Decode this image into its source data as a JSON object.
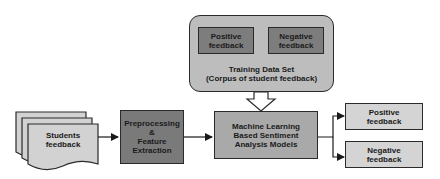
{
  "diagram": {
    "training_set": {
      "title_line1": "Training Data Set",
      "title_line2": "(Corpus of student feedback)",
      "positive": {
        "line1": "Positive",
        "line2": "feedback"
      },
      "negative": {
        "line1": "Negative",
        "line2": "feedback"
      }
    },
    "input": {
      "line1": "Students",
      "line2": "feedback"
    },
    "preprocessing": {
      "line1": "Preprocessing",
      "line2": "&",
      "line3": "Feature",
      "line4": "Extraction"
    },
    "model": {
      "line1": "Machine Learning",
      "line2": "Based Sentiment",
      "line3": "Analysis Models"
    },
    "outputs": {
      "positive": {
        "line1": "Positive",
        "line2": "feedback"
      },
      "negative": {
        "line1": "Negative",
        "line2": "feedback"
      }
    },
    "colors": {
      "training_bg": "#bdbdbd",
      "inner_boxes": "#7d7d7d",
      "input_docs": "#d2d2d2",
      "preprocessing": "#7a7a7a",
      "model": "#a9a9a9",
      "outputs": "#d4d4d4",
      "stroke": "#2a2a2a"
    }
  }
}
